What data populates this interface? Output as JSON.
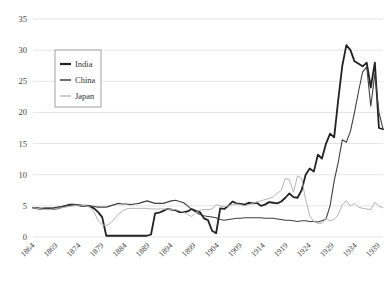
{
  "chart_data": {
    "type": "line",
    "title": "",
    "xlabel": "",
    "ylabel": "",
    "ylim": [
      0,
      35
    ],
    "ytick_step": 5,
    "yticks": [
      "0",
      "5",
      "10",
      "15",
      "20",
      "25",
      "30",
      "35"
    ],
    "grid": true,
    "legend_position": "upper-left",
    "xlim": [
      1864,
      1940
    ],
    "xticks": [
      "1864",
      "1869",
      "1874",
      "1879",
      "1884",
      "1889",
      "1894",
      "1899",
      "1904",
      "1909",
      "1914",
      "1919",
      "1924",
      "1929",
      "1934",
      "1939"
    ],
    "x_start": 1864,
    "x_end": 1940,
    "series": [
      {
        "name": "India",
        "color": "#222222",
        "width": 1.8,
        "values": [
          4.7,
          4.6,
          4.5,
          4.6,
          4.6,
          4.5,
          4.6,
          4.8,
          5.0,
          5.2,
          5.2,
          5.1,
          5.0,
          5.0,
          4.9,
          4.6,
          4.0,
          3.2,
          0.2,
          0.2,
          0.2,
          0.2,
          0.2,
          0.2,
          0.2,
          0.2,
          0.2,
          0.2,
          0.2,
          0.4,
          3.8,
          3.9,
          4.2,
          4.5,
          4.4,
          4.3,
          4.0,
          4.0,
          4.1,
          4.5,
          4.2,
          4.0,
          3.0,
          2.7,
          1.0,
          0.6,
          4.6,
          4.5,
          5.0,
          5.7,
          5.4,
          5.3,
          5.2,
          5.5,
          5.4,
          5.5,
          5.0,
          5.2,
          5.6,
          5.5,
          5.4,
          5.7,
          6.3,
          7.0,
          6.4,
          6.3,
          7.5,
          10.0,
          11.0,
          10.5,
          13.2,
          12.6,
          15.0,
          16.6,
          16.0,
          22.0,
          27.5,
          30.8,
          30.0,
          28.2,
          27.8,
          27.4,
          28.0,
          24.0,
          28.0,
          17.5,
          17.3
        ]
      },
      {
        "name": "China",
        "color": "#3f3f3f",
        "width": 1.1,
        "values": [
          4.7,
          4.7,
          4.6,
          4.6,
          4.6,
          4.7,
          4.8,
          4.9,
          5.0,
          5.1,
          5.2,
          5.2,
          5.1,
          5.1,
          5.0,
          4.9,
          4.8,
          4.8,
          4.8,
          5.0,
          5.2,
          5.4,
          5.3,
          5.3,
          5.2,
          5.3,
          5.4,
          5.6,
          5.8,
          5.6,
          5.4,
          5.4,
          5.4,
          5.6,
          5.8,
          5.9,
          5.7,
          5.5,
          5.0,
          4.4,
          4.0,
          3.6,
          3.4,
          3.3,
          3.2,
          3.1,
          2.8,
          2.7,
          2.8,
          2.9,
          3.0,
          3.0,
          3.1,
          3.1,
          3.1,
          3.1,
          3.1,
          3.0,
          3.0,
          3.0,
          2.9,
          2.8,
          2.7,
          2.7,
          2.6,
          2.5,
          2.6,
          2.6,
          2.5,
          2.5,
          2.4,
          2.6,
          2.9,
          5.0,
          9.0,
          12.0,
          15.6,
          15.2,
          17.0,
          20.0,
          23.4,
          26.5,
          27.3,
          21.0,
          26.2,
          20.0,
          17.4
        ]
      },
      {
        "name": "Japan",
        "color": "#b4b4b4",
        "width": 1.0,
        "values": [
          4.7,
          4.6,
          4.5,
          4.4,
          4.4,
          4.5,
          4.6,
          4.7,
          4.8,
          4.9,
          5.0,
          5.1,
          5.1,
          5.0,
          4.8,
          4.0,
          2.6,
          2.0,
          1.8,
          2.2,
          2.9,
          3.7,
          4.2,
          4.5,
          4.6,
          4.6,
          4.6,
          4.6,
          4.6,
          4.5,
          4.5,
          4.5,
          4.5,
          4.5,
          4.4,
          4.4,
          4.2,
          4.0,
          3.6,
          3.3,
          3.9,
          4.3,
          4.4,
          4.4,
          4.5,
          5.2,
          5.0,
          4.9,
          5.0,
          5.2,
          5.3,
          5.2,
          5.0,
          5.2,
          5.4,
          5.6,
          5.8,
          6.0,
          6.2,
          6.4,
          7.0,
          7.5,
          9.4,
          9.2,
          7.2,
          9.8,
          9.4,
          6.0,
          3.4,
          2.5,
          2.2,
          2.2,
          3.0,
          2.6,
          2.8,
          3.6,
          5.2,
          5.8,
          5.0,
          5.4,
          4.8,
          4.6,
          4.5,
          4.4,
          5.6,
          4.9,
          4.7
        ]
      }
    ]
  },
  "legend": {
    "items": [
      {
        "label": "India"
      },
      {
        "label": "China"
      },
      {
        "label": "Japan"
      }
    ]
  }
}
